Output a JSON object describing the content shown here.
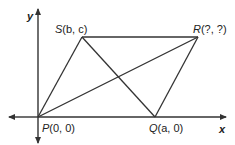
{
  "diagram": {
    "type": "coordinate-geometry",
    "axes": {
      "x_label": "x",
      "y_label": "y"
    },
    "points": {
      "P": {
        "name": "P",
        "coords": "(0, 0)"
      },
      "Q": {
        "name": "Q",
        "coords": "(a, 0)"
      },
      "S": {
        "name": "S",
        "coords": "(b, c)"
      },
      "R": {
        "name": "R",
        "coords": "(?, ?)"
      }
    },
    "segments": [
      "PS",
      "SR",
      "RQ",
      "PQ",
      "PR",
      "SQ"
    ],
    "colors": {
      "line": "#333333",
      "text": "#222222"
    }
  }
}
